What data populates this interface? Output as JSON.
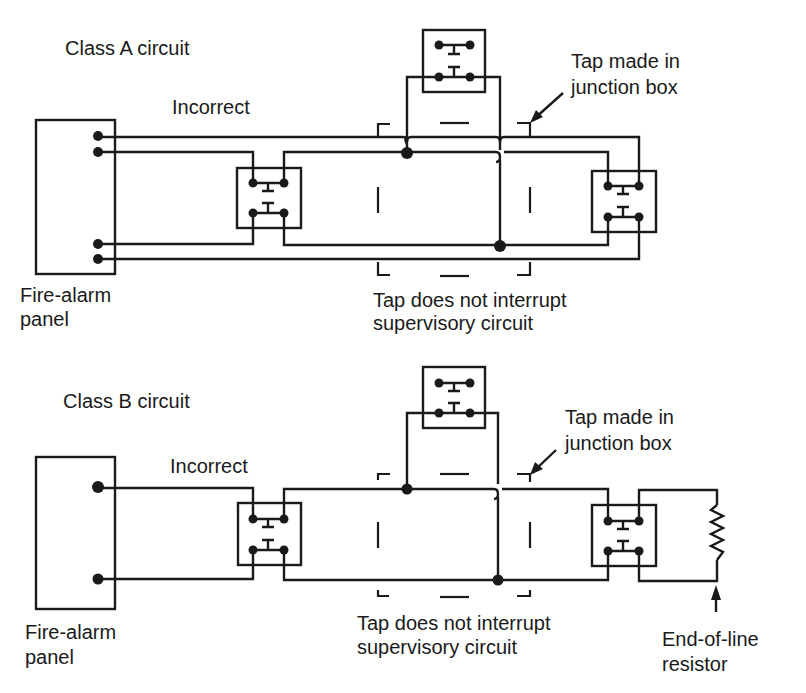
{
  "diagram": {
    "type": "fire-alarm wiring comparison",
    "colors": {
      "ink": "#1a1a1a",
      "background": "#ffffff"
    },
    "class_a": {
      "title": "Class A circuit",
      "status_label": "Incorrect",
      "panel_label_line1": "Fire-alarm",
      "panel_label_line2": "panel",
      "tap_callout_line1": "Tap made in",
      "tap_callout_line2": "junction box",
      "tap_note_line1": "Tap does not interrupt",
      "tap_note_line2": "supervisory circuit",
      "panel_terminals": 4,
      "devices": [
        "left-initiating-device",
        "tapped-initiating-device",
        "right-initiating-device"
      ]
    },
    "class_b": {
      "title": "Class B circuit",
      "status_label": "Incorrect",
      "panel_label_line1": "Fire-alarm",
      "panel_label_line2": "panel",
      "tap_callout_line1": "Tap made in",
      "tap_callout_line2": "junction box",
      "tap_note_line1": "Tap does not interrupt",
      "tap_note_line2": "supervisory circuit",
      "eol_label_line1": "End-of-line",
      "eol_label_line2": "resistor",
      "panel_terminals": 2,
      "devices": [
        "left-initiating-device",
        "tapped-initiating-device",
        "right-initiating-device",
        "end-of-line-resistor"
      ]
    }
  }
}
